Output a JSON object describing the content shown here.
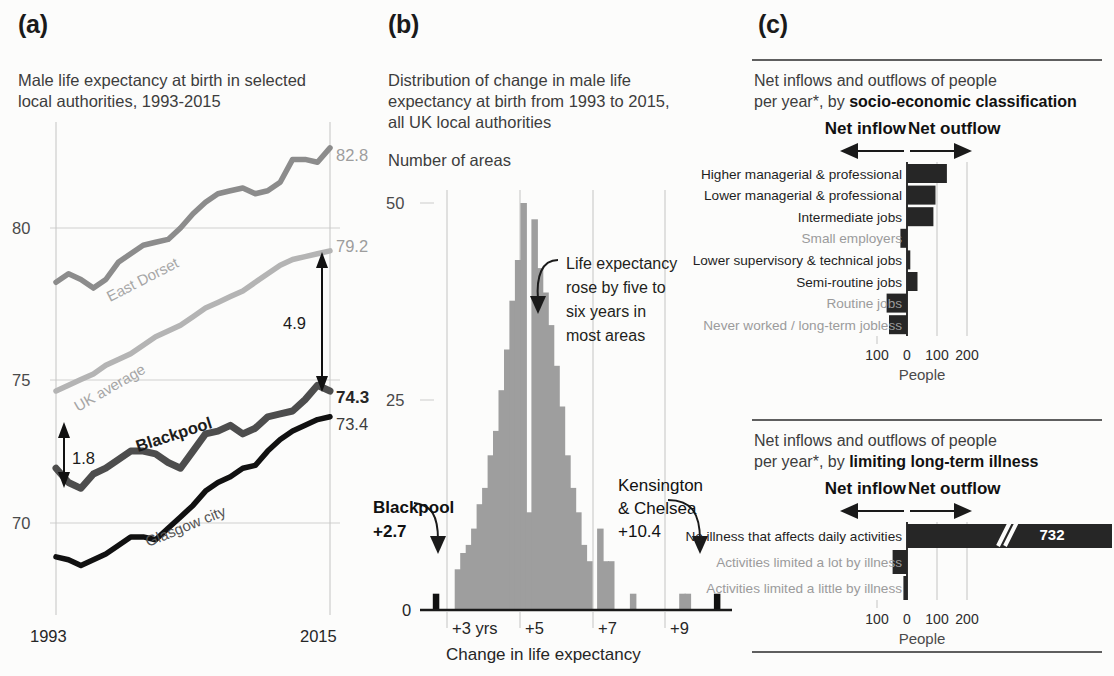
{
  "panels": {
    "a": {
      "tag": "(a)",
      "subtitle": "Male life expectancy at birth in selected\nlocal authorities, 1993-2015",
      "y_ticks": [
        "80",
        "75",
        "70"
      ],
      "x_ticks": [
        "1993",
        "2015"
      ],
      "end_labels": {
        "east_dorset": "82.8",
        "uk_average": "79.2",
        "blackpool": "74.3",
        "glasgow": "73.4"
      },
      "series_labels": {
        "east_dorset": "East Dorset",
        "uk_average": "UK average",
        "blackpool": "Blackpool",
        "glasgow": "Glasgow city"
      },
      "gap_labels": {
        "top": "4.9",
        "bottom": "1.8"
      }
    },
    "b": {
      "tag": "(b)",
      "subtitle": "Distribution of change in male life\nexpectancy at birth from 1993 to 2015,\nall UK local authorities",
      "y_axis_title": "Number of areas",
      "y_ticks": [
        "50",
        "25",
        "0"
      ],
      "x_ticks": [
        "+3 yrs",
        "+5",
        "+7",
        "+9"
      ],
      "x_axis_title": "Change in life expectancy",
      "annotation": "Life expectancy\nrose by five to\nsix years in\nmost areas",
      "callout_left_name": "Blackpool",
      "callout_left_value": "+2.7",
      "callout_right_name": "Kensington\n& Chelsea",
      "callout_right_value": "+10.4"
    },
    "c": {
      "tag": "(c)",
      "charts": [
        {
          "title_plain": "Net inflows and outflows of people\nper year*, by ",
          "title_bold": "socio-economic classification",
          "inflow_label": "Net inflow",
          "outflow_label": "Net outflow",
          "x_ticks": [
            "100",
            "0",
            "100",
            "200"
          ],
          "x_axis_title": "People",
          "categories": [
            {
              "label": "Higher managerial & professional",
              "grey": false
            },
            {
              "label": "Lower managerial & professional",
              "grey": false
            },
            {
              "label": "Intermediate jobs",
              "grey": false
            },
            {
              "label": "Small employers",
              "grey": true
            },
            {
              "label": "Lower supervisory & technical jobs",
              "grey": false
            },
            {
              "label": "Semi-routine jobs",
              "grey": false
            },
            {
              "label": "Routine jobs",
              "grey": true
            },
            {
              "label": "Never worked / long-term jobless",
              "grey": true
            }
          ]
        },
        {
          "title_plain": "Net inflows and outflows of people\nper year*, by ",
          "title_bold": "limiting long-term illness",
          "inflow_label": "Net inflow",
          "outflow_label": "Net outflow",
          "x_ticks": [
            "100",
            "0",
            "100",
            "200"
          ],
          "x_axis_title": "People",
          "broken_bar_value": "732",
          "categories": [
            {
              "label": "No illness that affects daily activities",
              "grey": false
            },
            {
              "label": "Activities limited a lot by illness",
              "grey": true
            },
            {
              "label": "Activities limited a little by illness",
              "grey": true
            }
          ]
        }
      ]
    }
  },
  "colors": {
    "black": "#111111",
    "dark_grey": "#4d4d4d",
    "mid_grey": "#8c8c8c",
    "light_grey": "#b4b4b4",
    "hist_bar": "#9e9e9e",
    "highlight_black": "#111111",
    "background": "#fcfcfb"
  },
  "chart_data": [
    {
      "id": "panel-a-lines",
      "type": "line",
      "title": "Male life expectancy at birth in selected local authorities, 1993-2015",
      "xlabel": "",
      "ylabel": "",
      "xlim": [
        1993,
        2015
      ],
      "ylim": [
        67.5,
        83.5
      ],
      "yticks": [
        70,
        75,
        80
      ],
      "xticks": [
        1993,
        2015
      ],
      "grid": "horizontal",
      "x": [
        1993,
        1994,
        1995,
        1996,
        1997,
        1998,
        1999,
        2000,
        2001,
        2002,
        2003,
        2004,
        2005,
        2006,
        2007,
        2008,
        2009,
        2010,
        2011,
        2012,
        2013,
        2014,
        2015
      ],
      "series": [
        {
          "name": "East Dorset",
          "color": "#8c8c8c",
          "values": [
            78.1,
            78.4,
            78.2,
            77.9,
            78.2,
            78.8,
            79.1,
            79.4,
            79.5,
            79.6,
            80.0,
            80.5,
            80.9,
            81.2,
            81.3,
            81.4,
            81.2,
            81.3,
            81.6,
            82.4,
            82.4,
            82.3,
            82.8
          ],
          "end_label": "82.8"
        },
        {
          "name": "UK average",
          "color": "#b4b4b4",
          "values": [
            74.3,
            74.5,
            74.7,
            74.9,
            75.2,
            75.4,
            75.6,
            75.9,
            76.2,
            76.4,
            76.6,
            76.9,
            77.2,
            77.4,
            77.6,
            77.8,
            78.1,
            78.4,
            78.7,
            78.9,
            79.0,
            79.1,
            79.2
          ],
          "end_label": "79.2"
        },
        {
          "name": "Blackpool",
          "color": "#4d4d4d",
          "values": [
            71.6,
            71.1,
            70.9,
            71.4,
            71.6,
            71.9,
            72.2,
            72.2,
            72.1,
            71.8,
            71.6,
            72.2,
            72.8,
            72.9,
            73.1,
            72.8,
            73.0,
            73.4,
            73.5,
            73.6,
            74.0,
            74.5,
            74.3
          ],
          "end_label": "74.3"
        },
        {
          "name": "Glasgow city",
          "color": "#111111",
          "values": [
            68.5,
            68.4,
            68.2,
            68.4,
            68.6,
            68.9,
            69.2,
            69.2,
            69.1,
            69.5,
            69.9,
            70.3,
            70.8,
            71.1,
            71.3,
            71.6,
            71.7,
            72.2,
            72.6,
            72.9,
            73.1,
            73.3,
            73.4
          ],
          "end_label": "73.4"
        }
      ],
      "annotations": [
        {
          "text": "4.9",
          "meaning": "gap between UK average (79.2) and Blackpool (74.3) in 2015"
        },
        {
          "text": "1.8",
          "meaning": "gap between UK average and Blackpool in 1993"
        }
      ]
    },
    {
      "id": "panel-b-histogram",
      "type": "bar",
      "title": "Distribution of change in male life expectancy at birth from 1993 to 2015, all UK local authorities",
      "xlabel": "Change in life expectancy",
      "ylabel": "Number of areas",
      "ylim": [
        0,
        52
      ],
      "yticks": [
        0,
        25,
        50
      ],
      "xticks": [
        3,
        5,
        7,
        9
      ],
      "xticklabels": [
        "+3 yrs",
        "+5",
        "+7",
        "+9"
      ],
      "bin_width": 0.15,
      "categories": [
        2.7,
        3.3,
        3.45,
        3.6,
        3.75,
        3.9,
        4.05,
        4.2,
        4.35,
        4.5,
        4.65,
        4.8,
        4.95,
        5.1,
        5.25,
        5.4,
        5.55,
        5.7,
        5.85,
        6.0,
        6.15,
        6.3,
        6.45,
        6.6,
        6.75,
        6.9,
        7.2,
        7.35,
        7.5,
        8.1,
        9.45,
        9.6,
        10.4
      ],
      "values": [
        2,
        5,
        7,
        8,
        10,
        13,
        15,
        19,
        22,
        27,
        32,
        38,
        43,
        50,
        12,
        48,
        42,
        39,
        35,
        30,
        25,
        19,
        15,
        12,
        8,
        6,
        10,
        6,
        6,
        2,
        2,
        2,
        2
      ],
      "highlighted": [
        {
          "x": 2.7,
          "label": "Blackpool",
          "value_label": "+2.7",
          "color": "#111111"
        },
        {
          "x": 10.4,
          "label": "Kensington & Chelsea",
          "value_label": "+10.4",
          "color": "#111111"
        }
      ],
      "bar_color": "#9e9e9e",
      "annotation": "Life expectancy rose by five to six years in most areas"
    },
    {
      "id": "panel-c-top-seg",
      "type": "bar",
      "orientation": "horizontal",
      "title": "Net inflows and outflows of people per year*, by socio-economic classification",
      "xlabel": "People",
      "xlim": [
        -130,
        230
      ],
      "xticks": [
        -100,
        0,
        100,
        200
      ],
      "xticklabels": [
        "100",
        "0",
        "100",
        "200"
      ],
      "categories": [
        "Higher managerial & professional",
        "Lower managerial & professional",
        "Intermediate jobs",
        "Small employers",
        "Lower supervisory & technical jobs",
        "Semi-routine jobs",
        "Routine jobs",
        "Never worked / long-term jobless"
      ],
      "values": [
        133,
        95,
        88,
        -22,
        11,
        35,
        -68,
        -60
      ],
      "bar_color": "#262626",
      "note": "positive = net outflow (right), negative = net inflow (left)"
    },
    {
      "id": "panel-c-bottom-illness",
      "type": "bar",
      "orientation": "horizontal",
      "title": "Net inflows and outflows of people per year*, by limiting long-term illness",
      "xlabel": "People",
      "xlim": [
        -130,
        230
      ],
      "xticks": [
        -100,
        0,
        100,
        200
      ],
      "xticklabels": [
        "100",
        "0",
        "100",
        "200"
      ],
      "categories": [
        "No illness that affects daily activities",
        "Activities limited a lot by illness",
        "Activities limited a little by illness"
      ],
      "values": [
        732,
        -48,
        -12
      ],
      "broken_axis": {
        "applies_to": "No illness that affects daily activities",
        "displayed_value": "732"
      },
      "bar_color": "#262626"
    }
  ]
}
